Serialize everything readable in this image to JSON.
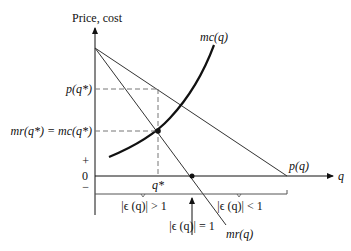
{
  "diagram": {
    "y_axis_label": "Price, cost",
    "x_axis_label": "q",
    "curves": {
      "mc": "mc(q)",
      "demand": "p(q)",
      "mr": "mr(q)"
    },
    "y_labels": {
      "price_at_optimum": "p(q*)",
      "mr_equals_mc": "mr(q*) = mc(q*)",
      "plus": "+",
      "zero": "0",
      "minus": "−"
    },
    "x_labels": {
      "optimum_quantity": "q*"
    },
    "elasticity_labels": {
      "elastic": "|ϵ (q)| > 1",
      "unit": "|ϵ (q)| = 1",
      "inelastic": "|ϵ (q)| < 1"
    },
    "colors": {
      "line": "#111111",
      "dashed": "#777777"
    }
  }
}
